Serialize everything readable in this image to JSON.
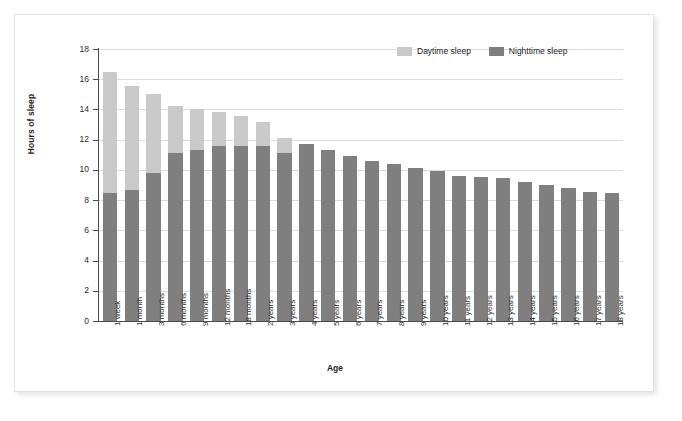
{
  "chart_data": {
    "type": "bar",
    "stacked": true,
    "title": "",
    "xlabel": "Age",
    "ylabel": "Hours of sleep",
    "ylim": [
      0,
      18
    ],
    "yticks": [
      0,
      2,
      4,
      6,
      8,
      10,
      12,
      14,
      16,
      18
    ],
    "grid": "horizontal",
    "legend_position": "top-right",
    "categories": [
      "1 week",
      "1 month",
      "3 months",
      "6 months",
      "9 months",
      "12 months",
      "18 months",
      "2 years",
      "3 years",
      "4 years",
      "5 years",
      "6 years",
      "7 years",
      "8 years",
      "9 years",
      "10 years",
      "11 years",
      "12 years",
      "13 years",
      "14 years",
      "15 years",
      "16 years",
      "17 years",
      "18 years"
    ],
    "series": [
      {
        "name": "Nighttime sleep",
        "color": "#7f7f7f",
        "values": [
          8.5,
          8.7,
          9.8,
          11.1,
          11.35,
          11.6,
          11.6,
          11.6,
          11.15,
          11.7,
          11.3,
          10.9,
          10.6,
          10.4,
          10.15,
          9.9,
          9.6,
          9.5,
          9.45,
          9.2,
          9.0,
          8.8,
          8.55,
          8.5
        ]
      },
      {
        "name": "Daytime sleep",
        "color": "#c9c9c9",
        "values": [
          8.0,
          6.85,
          5.25,
          3.15,
          2.7,
          2.25,
          2.0,
          1.55,
          0.95,
          0,
          0,
          0,
          0,
          0,
          0,
          0,
          0,
          0,
          0,
          0,
          0,
          0,
          0,
          0
        ]
      }
    ],
    "totals": [
      16.5,
      15.55,
      15.05,
      14.25,
      14.05,
      13.85,
      13.6,
      13.15,
      12.1,
      11.7,
      11.3,
      10.9,
      10.6,
      10.4,
      10.15,
      9.9,
      9.6,
      9.5,
      9.45,
      9.2,
      9.0,
      8.8,
      8.55,
      8.5
    ]
  },
  "legend": {
    "items": [
      {
        "label": "Daytime sleep",
        "color": "#c9c9c9"
      },
      {
        "label": "Nighttime sleep",
        "color": "#7f7f7f"
      }
    ]
  },
  "axes": {
    "y_title": "Hours of sleep",
    "x_title": "Age"
  }
}
